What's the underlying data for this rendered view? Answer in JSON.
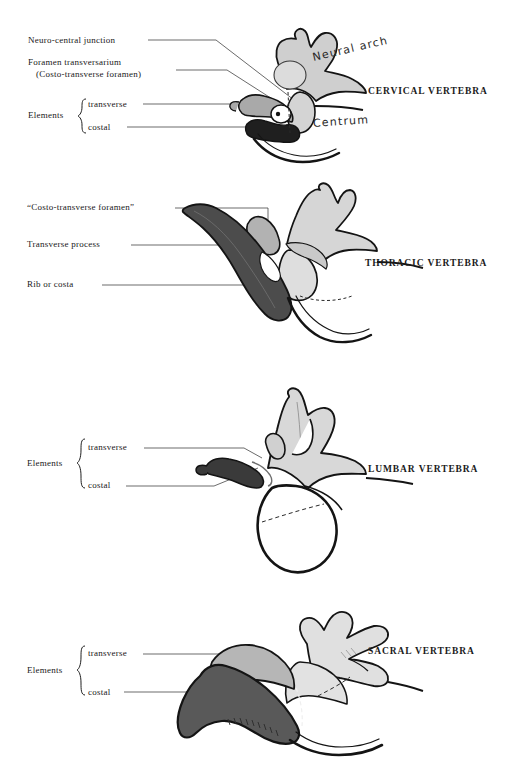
{
  "plate": {
    "title": "Vertebral elements — comparative plate",
    "background_color": "#ffffff",
    "ink_color": "#181818"
  },
  "palette": {
    "neural_arch_light": "#cccccc",
    "neural_arch_pale": "#dedede",
    "transverse_mid": "#a8a8a8",
    "costal_black": "#1f1f1f",
    "rib_dark_grey": "#4c4c4c",
    "sacral_costal_grey": "#595959",
    "outline": "#141414",
    "leader_line": "#2b2b2b"
  },
  "panels": [
    {
      "id": "cervical",
      "title": "CERVICAL VERTEBRA",
      "labels": [
        {
          "id": "neuro-central-junction",
          "text": "Neuro-central junction"
        },
        {
          "id": "foramen-transversarium",
          "text": "Foramen transversarium"
        },
        {
          "id": "costo-transverse-foramen",
          "text": "(Costo-transverse foramen)"
        },
        {
          "id": "elements",
          "text": "Elements"
        },
        {
          "id": "transverse",
          "text": "transverse"
        },
        {
          "id": "costal",
          "text": "costal"
        }
      ],
      "handwritten_labels": [
        {
          "id": "neural-arch",
          "text": "Neural arch"
        },
        {
          "id": "centrum",
          "text": "Centrum"
        }
      ]
    },
    {
      "id": "thoracic",
      "title": "THORACIC VERTEBRA",
      "labels": [
        {
          "id": "costo-transverse-foramen-quoted",
          "text": "“Costo-transverse foramen”"
        },
        {
          "id": "transverse-process",
          "text": "Transverse process"
        },
        {
          "id": "rib-or-costa",
          "text": "Rib or costa"
        }
      ],
      "handwritten_labels": []
    },
    {
      "id": "lumbar",
      "title": "LUMBAR VERTEBRA",
      "labels": [
        {
          "id": "elements",
          "text": "Elements"
        },
        {
          "id": "transverse",
          "text": "transverse"
        },
        {
          "id": "costal",
          "text": "costal"
        }
      ],
      "handwritten_labels": []
    },
    {
      "id": "sacral",
      "title": "SACRAL VERTEBRA",
      "labels": [
        {
          "id": "elements",
          "text": "Elements"
        },
        {
          "id": "transverse",
          "text": "transverse"
        },
        {
          "id": "costal",
          "text": "costal"
        }
      ],
      "handwritten_labels": []
    }
  ]
}
